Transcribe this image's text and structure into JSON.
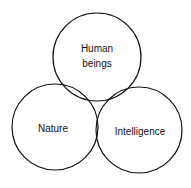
{
  "diagram": {
    "type": "three-circle-diagram",
    "stroke_color": "#111111",
    "background": "#ffffff",
    "circles": [
      {
        "id": "human-beings",
        "lines": [
          "Human",
          "beings"
        ],
        "cx": 97,
        "cy": 57,
        "r": 44
      },
      {
        "id": "nature",
        "lines": [
          "Nature"
        ],
        "cx": 55,
        "cy": 127,
        "r": 43
      },
      {
        "id": "intelligence",
        "lines": [
          "Intelligence"
        ],
        "cx": 139,
        "cy": 130,
        "r": 43
      }
    ]
  }
}
